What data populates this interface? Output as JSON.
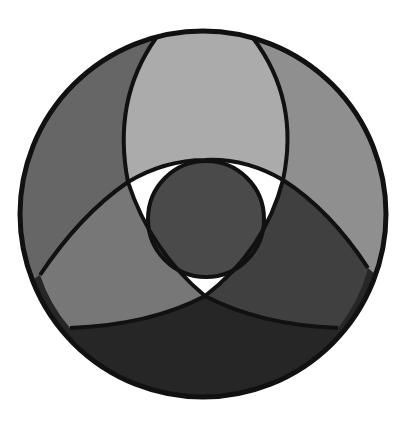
{
  "diagram": {
    "type": "overlapping-circles-in-circle",
    "canvas": {
      "width": 405,
      "height": 422,
      "background": "#ffffff"
    },
    "outer_circle": {
      "cx": 203,
      "cy": 214,
      "r": 183
    },
    "center_circle": {
      "cx": 206,
      "cy": 219,
      "r": 58,
      "fill": "#4a4a4a"
    },
    "regions": [
      {
        "name": "top-lens",
        "fill": "#ababab"
      },
      {
        "name": "upper-left-band",
        "fill": "#666666"
      },
      {
        "name": "upper-right-band",
        "fill": "#8f8f8f"
      },
      {
        "name": "lower-left-lens",
        "fill": "#777777"
      },
      {
        "name": "lower-right-lens",
        "fill": "#404040"
      },
      {
        "name": "bottom-band",
        "fill": "#262626"
      },
      {
        "name": "inner-gaps",
        "fill": "#ffffff"
      }
    ],
    "outline_color": "#111111"
  }
}
